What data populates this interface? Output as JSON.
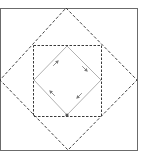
{
  "diagram": {
    "type": "nested-squares-geometric-construction",
    "colors": {
      "background": "#ffffff",
      "frame": "#6b6b6b",
      "outer_diamond": "#2e2e2e",
      "dashed_square": "#3a3a3a",
      "inner_diamond": "#a8a8a8",
      "arrows": "#7a7a7a",
      "vertex_marker": "#555555"
    },
    "frame": {
      "x": 0,
      "y": 8,
      "width": 137,
      "height": 142
    },
    "outer_diamond": {
      "style": "dashed",
      "points": [
        [
          66,
          8
        ],
        [
          137,
          80
        ],
        [
          68,
          150
        ],
        [
          0,
          80
        ]
      ]
    },
    "dashed_square": {
      "style": "dashed",
      "x": 33,
      "y": 45,
      "width": 68,
      "height": 71
    },
    "inner_diamond": {
      "style": "solid",
      "points": [
        [
          67,
          46
        ],
        [
          101,
          80
        ],
        [
          67,
          115
        ],
        [
          34,
          80
        ]
      ]
    },
    "flow_direction": "clockwise",
    "arrows": [
      {
        "edge": "top-left",
        "x": 56,
        "y": 63,
        "angle": -45
      },
      {
        "edge": "top-right",
        "x": 85,
        "y": 69,
        "angle": 45
      },
      {
        "edge": "bottom-right",
        "x": 79,
        "y": 96,
        "angle": 135
      },
      {
        "edge": "bottom-left",
        "x": 52,
        "y": 93,
        "angle": -135
      }
    ],
    "vertex_marker": {
      "x": 67,
      "y": 115
    }
  }
}
